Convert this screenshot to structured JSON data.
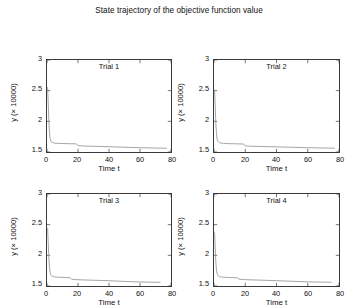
{
  "figure": {
    "title": "State trajectory of the objective function value",
    "line_color": "#9a9a9a",
    "axis_color": "#3a3a3a",
    "background": "#ffffff"
  },
  "chart_data": [
    {
      "type": "line",
      "title": "Trial 1",
      "xlabel": "Time t",
      "ylabel": "y (× 10000)",
      "xlim": [
        0,
        80
      ],
      "ylim": [
        1.5,
        3
      ],
      "xticks": [
        0,
        20,
        40,
        60,
        80
      ],
      "yticks": [
        1.5,
        2,
        2.5,
        3
      ],
      "grid": false,
      "x": [
        0,
        0.4,
        0.8,
        1.2,
        1.6,
        2,
        2.5,
        3,
        3.5,
        4,
        5,
        6,
        8,
        10,
        13,
        16,
        18,
        19,
        20,
        22,
        25,
        30,
        35,
        40,
        45,
        50,
        55,
        60,
        65,
        70,
        75,
        77
      ],
      "y": [
        2.56,
        2.55,
        2.3,
        2.0,
        1.82,
        1.72,
        1.68,
        1.66,
        1.655,
        1.65,
        1.645,
        1.642,
        1.64,
        1.638,
        1.636,
        1.634,
        1.633,
        1.632,
        1.605,
        1.6,
        1.597,
        1.593,
        1.59,
        1.586,
        1.582,
        1.578,
        1.574,
        1.57,
        1.567,
        1.564,
        1.562,
        1.561
      ]
    },
    {
      "type": "line",
      "title": "Trial 2",
      "xlabel": "Time t",
      "ylabel": "y (× 10000)",
      "xlim": [
        0,
        80
      ],
      "ylim": [
        1.5,
        3
      ],
      "xticks": [
        0,
        20,
        40,
        60,
        80
      ],
      "yticks": [
        1.5,
        2,
        2.5,
        3
      ],
      "grid": false,
      "x": [
        0,
        0.4,
        0.8,
        1.2,
        1.6,
        2,
        2.5,
        3,
        3.5,
        4,
        5,
        6,
        8,
        10,
        13,
        16,
        18,
        19,
        20,
        22,
        25,
        30,
        35,
        40,
        45,
        50,
        55,
        60,
        65,
        70,
        75,
        77
      ],
      "y": [
        2.52,
        2.5,
        2.22,
        1.95,
        1.8,
        1.71,
        1.675,
        1.66,
        1.652,
        1.648,
        1.644,
        1.641,
        1.638,
        1.636,
        1.634,
        1.632,
        1.631,
        1.63,
        1.6,
        1.596,
        1.593,
        1.59,
        1.587,
        1.584,
        1.58,
        1.577,
        1.573,
        1.57,
        1.567,
        1.565,
        1.563,
        1.562
      ]
    },
    {
      "type": "line",
      "title": "Trial 3",
      "xlabel": "Time t",
      "ylabel": "y (× 10000)",
      "xlim": [
        0,
        80
      ],
      "ylim": [
        1.5,
        3
      ],
      "xticks": [
        0,
        20,
        40,
        60,
        80
      ],
      "yticks": [
        1.5,
        2,
        2.5,
        3
      ],
      "grid": false,
      "x": [
        0,
        0.4,
        0.8,
        1.2,
        1.6,
        2,
        2.5,
        3,
        3.5,
        4,
        5,
        6,
        8,
        10,
        12,
        14,
        15,
        16,
        18,
        20,
        25,
        30,
        35,
        40,
        45,
        50,
        55,
        60,
        65,
        70,
        73
      ],
      "y": [
        2.45,
        2.44,
        2.2,
        1.95,
        1.8,
        1.72,
        1.685,
        1.668,
        1.66,
        1.655,
        1.65,
        1.646,
        1.642,
        1.64,
        1.638,
        1.636,
        1.635,
        1.61,
        1.605,
        1.602,
        1.598,
        1.594,
        1.59,
        1.586,
        1.58,
        1.575,
        1.57,
        1.566,
        1.563,
        1.561,
        1.56
      ]
    },
    {
      "type": "line",
      "title": "Trial 4",
      "xlabel": "Time t",
      "ylabel": "y (× 10000)",
      "xlim": [
        0,
        80
      ],
      "ylim": [
        1.5,
        3
      ],
      "xticks": [
        0,
        20,
        40,
        60,
        80
      ],
      "yticks": [
        1.5,
        2,
        2.5,
        3
      ],
      "grid": false,
      "x": [
        0,
        0.4,
        0.8,
        1.2,
        1.6,
        2,
        2.5,
        3,
        3.5,
        4,
        5,
        6,
        8,
        10,
        12,
        14,
        15,
        16,
        18,
        20,
        25,
        30,
        35,
        40,
        45,
        50,
        55,
        60,
        65,
        70,
        75
      ],
      "y": [
        2.38,
        2.36,
        2.1,
        1.88,
        1.76,
        1.7,
        1.672,
        1.66,
        1.654,
        1.65,
        1.646,
        1.643,
        1.64,
        1.638,
        1.636,
        1.634,
        1.633,
        1.612,
        1.607,
        1.603,
        1.599,
        1.595,
        1.591,
        1.587,
        1.582,
        1.577,
        1.572,
        1.568,
        1.565,
        1.563,
        1.561
      ]
    }
  ]
}
